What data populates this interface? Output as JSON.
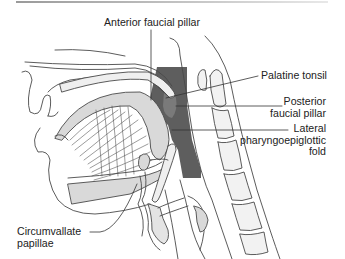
{
  "figure": {
    "colors": {
      "line": "#4a4a4a",
      "pharynx_fill": "#5e5e5e",
      "tissue_fill": "#d9d9d9",
      "light_fill": "#efefef",
      "background": "#ffffff"
    },
    "labels": {
      "anterior_faucial_pillar": "Anterior faucial pillar",
      "palatine_tonsil": "Palatine tonsil",
      "posterior_faucial_pillar_line1": "Posterior",
      "posterior_faucial_pillar_line2": "faucial pillar",
      "lateral_fold_line1": "Lateral",
      "lateral_fold_line2": "pharyngoepiglottic",
      "lateral_fold_line3": "fold",
      "circumvallate_line1": "Circumvallate",
      "circumvallate_line2": "papillae"
    }
  }
}
